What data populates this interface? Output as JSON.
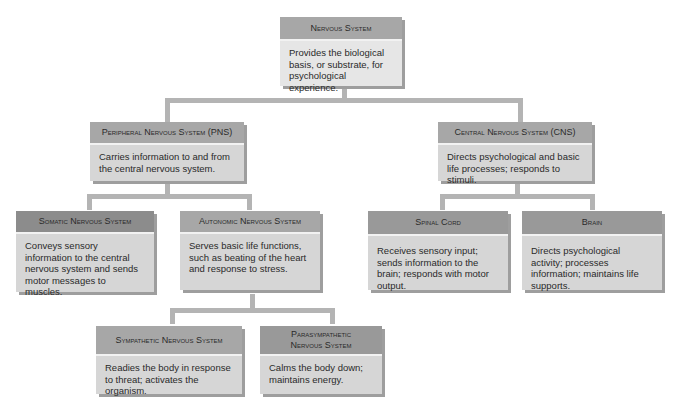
{
  "diagram": {
    "root": {
      "title": "Nervous System",
      "desc": "Provides the biological basis, or substrate, for psychological experience."
    },
    "pns": {
      "title": "Peripheral Nervous System (PNS)",
      "desc": "Carries information to and from the central nervous system."
    },
    "cns": {
      "title": "Central Nervous System (CNS)",
      "desc": "Directs psychological and basic life processes; responds to stimuli."
    },
    "somatic": {
      "title": "Somatic Nervous System",
      "desc": "Conveys sensory information to the central nervous system and sends motor messages to muscles."
    },
    "autonomic": {
      "title": "Autonomic Nervous System",
      "desc": "Serves basic life functions, such as beating of the heart and response to stress."
    },
    "spinal": {
      "title": "Spinal Cord",
      "desc": "Receives sensory input; sends information to the brain; responds with motor output."
    },
    "brain": {
      "title": "Brain",
      "desc": "Directs psychological activity; processes information; maintains life supports."
    },
    "sympathetic": {
      "title": "Sympathetic Nervous System",
      "desc": "Readies the body in response to threat; activates the organism."
    },
    "parasympathetic": {
      "title": "Parasympathetic Nervous System",
      "desc": "Calms the body down; maintains energy."
    }
  },
  "colors": {
    "header": "#a7a7a7",
    "header_dark": "#8c8c8c",
    "body": "#d6d6d6",
    "connector": "#b4b4b4"
  }
}
